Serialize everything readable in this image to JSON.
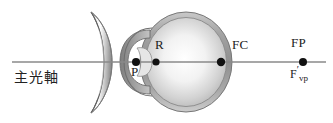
{
  "figure": {
    "width": 333,
    "height": 123,
    "background": "#ffffff"
  },
  "labels": {
    "axis_cjk": "主光軸",
    "retina_point": "R",
    "principal_point": "P",
    "far_center_point": "FC",
    "far_point": "FP",
    "vertex_focus_F": "F",
    "vertex_focus_prime": "′",
    "vertex_focus_sub": "vp"
  },
  "optical_axis": {
    "name": "principal-optical-axis",
    "y": 62,
    "x_start": 12,
    "x_end": 326,
    "color": "#8a8a8a",
    "width": 1.6
  },
  "points": [
    {
      "id": "P",
      "label": "P",
      "x": 136,
      "y": 62,
      "radius": 4.0,
      "color": "#111111"
    },
    {
      "id": "R",
      "label": "R",
      "x": 156,
      "y": 62,
      "radius": 3.6,
      "color": "#111111"
    },
    {
      "id": "FC",
      "label": "FC",
      "x": 221,
      "y": 62,
      "radius": 4.2,
      "color": "#111111"
    },
    {
      "id": "FP",
      "label": "FP",
      "x": 303,
      "y": 62,
      "radius": 4.0,
      "color": "#111111"
    }
  ],
  "lens": {
    "name": "concave-diverging-lens",
    "type": "biconcave-meniscus",
    "x_center": 100,
    "top_y": 12,
    "bottom_y": 113,
    "edge_thickness": 9,
    "fill_light": "#ffffff",
    "fill_dark": "#8d8d8d",
    "stroke": "#6f6f6f"
  },
  "eyeball": {
    "name": "eyeball-globe",
    "cx": 186,
    "cy": 62,
    "rx": 46,
    "ry": 50,
    "shell_color": "#9b9b9b",
    "interior_light": "#fdfdfd",
    "interior_shade": "#b8b8b8",
    "stroke": "#7c7c7c"
  },
  "cornea": {
    "name": "cornea-anterior-chamber",
    "cx": 142,
    "cy": 62,
    "rx": 22,
    "ry": 33,
    "fill": "#8f8f8f",
    "stroke": "#6a6a6a"
  },
  "colors": {
    "ink": "#1b1b1b",
    "axis_gray": "#8a8a8a",
    "mid_gray": "#9b9b9b",
    "dark_gray": "#6a6a6a",
    "light_gray": "#d6d6d6"
  }
}
